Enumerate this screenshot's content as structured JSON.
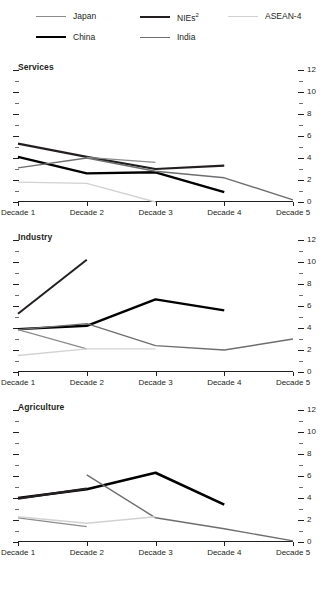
{
  "legend": {
    "items": [
      {
        "label": "Japan",
        "key": "japan",
        "color": "#8c8c8c",
        "width": 1.2,
        "row": 0,
        "col": 0
      },
      {
        "label": "NIEs",
        "key": "nies",
        "color": "#231f20",
        "width": 2.2,
        "row": 0,
        "col": 1,
        "sup": "2"
      },
      {
        "label": "ASEAN-4",
        "key": "asean4",
        "color": "#d2d2d2",
        "width": 1.2,
        "row": 0,
        "col": 2
      },
      {
        "label": "China",
        "key": "china",
        "color": "#000000",
        "width": 2.4,
        "row": 1,
        "col": 0
      },
      {
        "label": "India",
        "key": "india",
        "color": "#6d6e71",
        "width": 1.4,
        "row": 1,
        "col": 1
      }
    ]
  },
  "axis": {
    "x_categories": [
      "Decade 1",
      "Decade 2",
      "Decade 3",
      "Decade 4",
      "Decade 5"
    ],
    "y_major_ticks": [
      0,
      2,
      4,
      6,
      8,
      10,
      12
    ],
    "y_minor_ticks": [
      1,
      3,
      5,
      7,
      9,
      11
    ],
    "ylim": [
      0,
      12
    ],
    "y_labels_side": "right"
  },
  "chart_data": [
    {
      "type": "line",
      "title": "Services",
      "xlabel": "",
      "ylabel": "",
      "ylim": [
        0,
        12
      ],
      "grid": false,
      "legend_position": "top",
      "categories": [
        "Decade 1",
        "Decade 2",
        "Decade 3",
        "Decade 4",
        "Decade 5"
      ],
      "series": [
        {
          "name": "NIEs",
          "color": "#231f20",
          "width": 2.2,
          "x": [
            1,
            2,
            3,
            4
          ],
          "values": [
            5.3,
            4.1,
            3.0,
            3.3
          ]
        },
        {
          "name": "China",
          "color": "#000000",
          "width": 2.4,
          "x": [
            1,
            2,
            3,
            4
          ],
          "values": [
            4.1,
            2.6,
            2.7,
            0.9
          ]
        },
        {
          "name": "India",
          "color": "#6d6e71",
          "width": 1.4,
          "x": [
            1,
            2,
            3,
            4,
            5
          ],
          "values": [
            3.1,
            4.0,
            2.8,
            2.2,
            0.2
          ]
        },
        {
          "name": "Japan",
          "color": "#8c8c8c",
          "width": 1.2,
          "x": [
            2,
            3
          ],
          "values": [
            4.05,
            3.6
          ]
        },
        {
          "name": "ASEAN-4",
          "color": "#d2d2d2",
          "width": 1.3,
          "x": [
            1,
            2,
            3
          ],
          "values": [
            1.8,
            1.7,
            0.0
          ]
        }
      ]
    },
    {
      "type": "line",
      "title": "Industry",
      "xlabel": "",
      "ylabel": "",
      "ylim": [
        0,
        12
      ],
      "grid": false,
      "legend_position": "top",
      "categories": [
        "Decade 1",
        "Decade 2",
        "Decade 3",
        "Decade 4",
        "Decade 5"
      ],
      "series": [
        {
          "name": "NIEs",
          "color": "#231f20",
          "width": 2.0,
          "x": [
            1,
            2
          ],
          "values": [
            5.3,
            10.2
          ]
        },
        {
          "name": "China",
          "color": "#000000",
          "width": 2.4,
          "x": [
            1,
            2,
            3,
            4
          ],
          "values": [
            3.9,
            4.2,
            6.6,
            5.6
          ]
        },
        {
          "name": "India",
          "color": "#6d6e71",
          "width": 1.4,
          "x": [
            1,
            2,
            3,
            4,
            5
          ],
          "values": [
            3.85,
            4.4,
            2.4,
            2.0,
            3.0
          ]
        },
        {
          "name": "Japan",
          "color": "#8c8c8c",
          "width": 1.3,
          "x": [
            1,
            2
          ],
          "values": [
            3.85,
            2.1
          ]
        },
        {
          "name": "ASEAN-4",
          "color": "#d2d2d2",
          "width": 1.3,
          "x": [
            1,
            2,
            3
          ],
          "values": [
            1.5,
            2.1,
            2.1
          ]
        }
      ]
    },
    {
      "type": "line",
      "title": "Agriculture",
      "xlabel": "",
      "ylabel": "",
      "ylim": [
        0,
        12
      ],
      "grid": false,
      "legend_position": "top",
      "categories": [
        "Decade 1",
        "Decade 2",
        "Decade 3",
        "Decade 4",
        "Decade 5"
      ],
      "series": [
        {
          "name": "China",
          "color": "#000000",
          "width": 2.6,
          "x": [
            1,
            2,
            3,
            4
          ],
          "values": [
            4.0,
            4.8,
            6.3,
            3.4
          ]
        },
        {
          "name": "NIEs",
          "color": "#231f20",
          "width": 2.2,
          "x": [
            1,
            2
          ],
          "values": [
            3.95,
            4.85
          ]
        },
        {
          "name": "India",
          "color": "#6d6e71",
          "width": 1.4,
          "x": [
            2,
            3,
            4,
            5
          ],
          "values": [
            6.1,
            2.2,
            1.2,
            0.1
          ]
        },
        {
          "name": "Japan",
          "color": "#8c8c8c",
          "width": 1.3,
          "x": [
            1,
            2
          ],
          "values": [
            2.2,
            1.4
          ]
        },
        {
          "name": "ASEAN-4",
          "color": "#d2d2d2",
          "width": 1.4,
          "x": [
            1,
            2,
            3
          ],
          "values": [
            2.3,
            1.7,
            2.3
          ]
        }
      ]
    }
  ]
}
